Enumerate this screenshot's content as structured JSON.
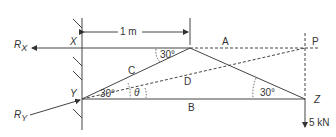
{
  "diagram": {
    "dimension": "1 m",
    "labels": {
      "rx": "R",
      "rx_sub": "X",
      "ry": "R",
      "ry_sub": "Y",
      "x": "X",
      "y": "Y",
      "z": "Z",
      "p": "P",
      "a": "A",
      "b": "B",
      "c": "C",
      "d": "D",
      "theta": "θ"
    },
    "angles": {
      "top": "30°",
      "y_left": "30°",
      "z": "30°"
    },
    "load": "5 kN",
    "colors": {
      "line": "#444444",
      "text": "#333333"
    }
  }
}
